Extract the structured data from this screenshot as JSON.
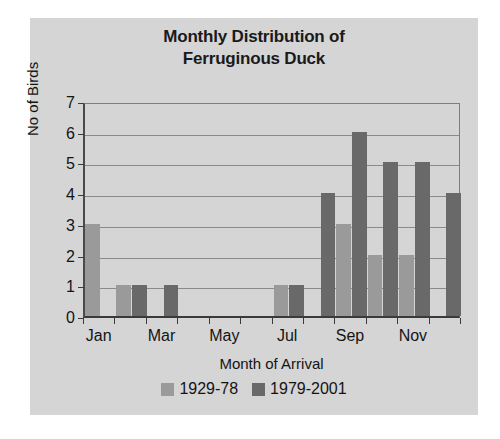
{
  "figure": {
    "background_color": "#d5d5d5",
    "title_lines": [
      "Monthly Distribution of",
      "Ferruginous Duck"
    ]
  },
  "chart_data": {
    "type": "bar",
    "title": "Monthly Distribution of Ferruginous Duck",
    "xlabel": "Month of Arrival",
    "ylabel": "No of Birds",
    "categories": [
      "Jan",
      "Feb",
      "Mar",
      "Apr",
      "May",
      "Jun",
      "Jul",
      "Aug",
      "Sep",
      "Oct",
      "Nov",
      "Dec"
    ],
    "tick_labels": [
      "Jan",
      "Mar",
      "May",
      "Jul",
      "Sep",
      "Nov"
    ],
    "tick_label_months": [
      0,
      2,
      4,
      6,
      8,
      10
    ],
    "ylim": [
      0,
      7
    ],
    "yticks": [
      0,
      1,
      2,
      3,
      4,
      5,
      6,
      7
    ],
    "grid": true,
    "grid_axis": "y",
    "legend_position": "bottom",
    "series": [
      {
        "name": "1929-78",
        "color": "#9a9a9a",
        "values": [
          3,
          1,
          0,
          0,
          0,
          0,
          1,
          0,
          3,
          2,
          2,
          0
        ]
      },
      {
        "name": "1979-2001",
        "color": "#696969",
        "values": [
          0,
          1,
          1,
          0,
          0,
          0,
          1,
          4,
          6,
          5,
          5,
          4
        ]
      }
    ]
  },
  "legend": {
    "entries": [
      {
        "label": "1929-78",
        "color": "#9a9a9a"
      },
      {
        "label": "1979-2001",
        "color": "#696969"
      }
    ]
  },
  "colors": {
    "series_1929_78": "#9a9a9a",
    "series_1979_2001": "#696969",
    "panel": "#d5d5d5",
    "axis": "#3a3a3a",
    "gridline": "#8a8a8a",
    "text": "#141414"
  }
}
